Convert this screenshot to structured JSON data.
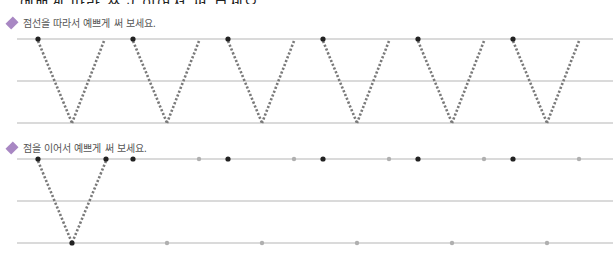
{
  "cropped_top_text": "예쁘게 따라 쓰고 이어서 써 보세요",
  "section1": {
    "instruction": "점선을 따라서 예쁘게 써 보세요.",
    "diamond_color": "#a887c3",
    "lines_y": [
      39,
      81,
      123
    ],
    "vs": [
      {
        "left": 38,
        "bottom": 72,
        "right": 104
      },
      {
        "left": 133,
        "bottom": 167,
        "right": 199
      },
      {
        "left": 228,
        "bottom": 262,
        "right": 294
      },
      {
        "left": 323,
        "bottom": 357,
        "right": 389
      },
      {
        "left": 418,
        "bottom": 452,
        "right": 484
      },
      {
        "left": 513,
        "bottom": 547,
        "right": 579
      }
    ]
  },
  "section2": {
    "instruction": "점을 이어서 예쁘게 써 보세요.",
    "diamond_color": "#a887c3",
    "lines_y": [
      159,
      201,
      243
    ],
    "example_v": {
      "left": 38,
      "bottom": 72,
      "right": 106
    },
    "top_dark_dots": [
      38,
      106,
      133,
      228,
      323,
      418,
      513
    ],
    "top_gray_dots": [
      199,
      294,
      389,
      484,
      579
    ],
    "bottom_dark_dots": [
      72
    ],
    "bottom_gray_dots": [
      167,
      262,
      357,
      452,
      547
    ]
  },
  "colors": {
    "line": "#b5b5b5",
    "dotted": "#7a7a7a",
    "dark_dot": "#222222",
    "gray_dot": "#b0b0b0"
  }
}
